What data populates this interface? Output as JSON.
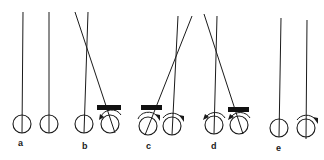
{
  "figure": {
    "panels": [
      {
        "label": "a",
        "pendulums": [
          {
            "cx": 22,
            "cy": 124,
            "top": [
              23,
              12
            ],
            "string": "vertical"
          },
          {
            "cx": 49,
            "cy": 124,
            "top": [
              49,
              12
            ],
            "string": "vertical"
          }
        ],
        "bar": null,
        "arrows": []
      },
      {
        "label": "b",
        "pendulums": [
          {
            "cx": 84,
            "cy": 124,
            "top": [
              88,
              12
            ],
            "string": "vertical"
          },
          {
            "cx": 110,
            "cy": 124,
            "top": [
              75,
              12
            ],
            "string": "diagonal"
          }
        ],
        "bar": {
          "x": 97,
          "y": 105,
          "w": 24,
          "h": 5
        },
        "arrows": [
          {
            "on": "right",
            "dir": "ccw"
          }
        ]
      },
      {
        "label": "c",
        "pendulums": [
          {
            "cx": 148,
            "cy": 126,
            "top": [
              192,
              16
            ],
            "string": "diagonal"
          },
          {
            "cx": 172,
            "cy": 126,
            "top": [
              178,
              16
            ],
            "string": "vertical"
          }
        ],
        "bar": {
          "x": 141,
          "y": 105,
          "w": 21,
          "h": 5
        },
        "arrows": [
          {
            "on": "left",
            "dir": "cw"
          },
          {
            "on": "right",
            "dir": "cw"
          }
        ]
      },
      {
        "label": "d",
        "pendulums": [
          {
            "cx": 214,
            "cy": 125,
            "top": [
              217,
              16
            ],
            "string": "vertical"
          },
          {
            "cx": 239,
            "cy": 125,
            "top": [
              204,
              14
            ],
            "string": "diagonal"
          }
        ],
        "bar": {
          "x": 228,
          "y": 107,
          "w": 21,
          "h": 5
        },
        "arrows": [
          {
            "on": "left",
            "dir": "ccw"
          },
          {
            "on": "right",
            "dir": "ccw"
          }
        ]
      },
      {
        "label": "e",
        "pendulums": [
          {
            "cx": 279,
            "cy": 128,
            "top": [
              281,
              18
            ],
            "string": "vertical"
          },
          {
            "cx": 306,
            "cy": 128,
            "top": [
              307,
              20
            ],
            "string": "vertical"
          }
        ],
        "bar": null,
        "arrows": [
          {
            "on": "right",
            "dir": "cw"
          }
        ]
      }
    ],
    "labels": {
      "a": "a",
      "b": "b",
      "c": "c",
      "d": "d",
      "e": "e"
    },
    "colors": {
      "ink": "#1a1a1a",
      "background": "#ffffff"
    }
  }
}
